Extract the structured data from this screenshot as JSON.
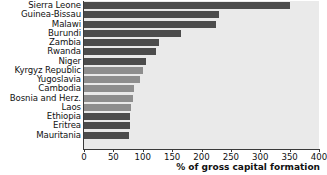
{
  "chart_data": {
    "type": "bar",
    "orientation": "horizontal",
    "title": "",
    "subtitle": "",
    "xlabel": "% of gross capital formation",
    "ylabel": "",
    "xlim": [
      0,
      400
    ],
    "xticks": [
      0,
      50,
      100,
      150,
      200,
      250,
      300,
      350,
      400
    ],
    "xtick_labels": [
      "0",
      "50",
      "100",
      "150",
      "200",
      "250",
      "300",
      "350",
      "400"
    ],
    "grid": false,
    "legend": null,
    "categories": [
      "Sierra Leone",
      "Guinea-Bissau",
      "Malawi",
      "Burundi",
      "Zambia",
      "Rwanda",
      "Niger",
      "Kyrgyz Republic",
      "Yugoslavia",
      "Cambodia",
      "Bosnia and Herz.",
      "Laos",
      "Ethiopia",
      "Eritrea",
      "Mauritania"
    ],
    "values": [
      350,
      230,
      224,
      165,
      127,
      122,
      105,
      100,
      95,
      85,
      83,
      80,
      79,
      78,
      77
    ],
    "bar_colors": [
      "#4c4c4c",
      "#4c4c4c",
      "#4c4c4c",
      "#4c4c4c",
      "#4c4c4c",
      "#4c4c4c",
      "#4c4c4c",
      "#8e8e8e",
      "#8e8e8e",
      "#8e8e8e",
      "#8e8e8e",
      "#8e8e8e",
      "#4c4c4c",
      "#4c4c4c",
      "#4c4c4c"
    ]
  },
  "style": {
    "plot_background": "#eaeaea",
    "page_background": "#ffffff",
    "axis_color": "#3a3a3a",
    "text_color": "#111111",
    "bar_dark": "#4c4c4c",
    "bar_light": "#8e8e8e"
  }
}
